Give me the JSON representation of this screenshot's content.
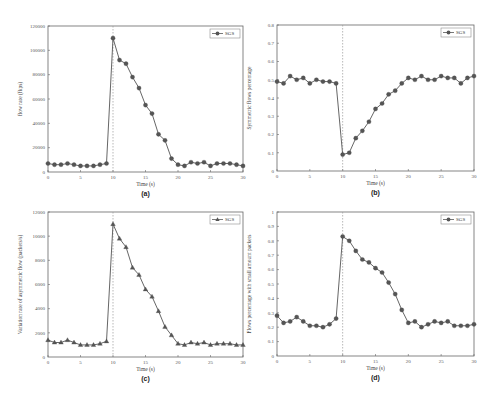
{
  "chart_data": [
    {
      "id": "a",
      "panel_label": "(a)",
      "type": "line",
      "marker": "circle",
      "xlabel": "Time (s)",
      "ylabel": "flow rate (fkps)",
      "xlim": [
        0,
        30
      ],
      "ylim": [
        0,
        120000
      ],
      "xticks": [
        0,
        5,
        10,
        15,
        20,
        25,
        30
      ],
      "yticks": [
        20000,
        40000,
        60000,
        80000,
        100000,
        120000
      ],
      "vline_x": 10,
      "legend": [
        "SGS"
      ],
      "legend_position": "upper right",
      "x": [
        0,
        1,
        2,
        3,
        4,
        5,
        6,
        7,
        8,
        9,
        10,
        11,
        12,
        13,
        14,
        15,
        16,
        17,
        18,
        19,
        20,
        21,
        22,
        23,
        24,
        25,
        26,
        27,
        28,
        29,
        30
      ],
      "series": [
        {
          "name": "SGS",
          "values": [
            7000,
            6000,
            6000,
            7000,
            6000,
            5000,
            5000,
            5000,
            6000,
            7000,
            110000,
            92000,
            89000,
            78000,
            69000,
            55000,
            48000,
            31000,
            26000,
            11000,
            6000,
            5000,
            8000,
            7000,
            8000,
            5000,
            7000,
            7000,
            7000,
            6000,
            5000
          ]
        }
      ]
    },
    {
      "id": "b",
      "panel_label": "(b)",
      "type": "line",
      "marker": "circle",
      "xlabel": "Time (s)",
      "ylabel": "Symmetric flows percentage",
      "xlim": [
        0,
        30
      ],
      "ylim": [
        0,
        0.8
      ],
      "xticks": [
        0,
        5,
        10,
        15,
        20,
        25,
        30
      ],
      "yticks": [
        0.1,
        0.2,
        0.3,
        0.4,
        0.5,
        0.6,
        0.7,
        0.8
      ],
      "vline_x": 10,
      "legend": [
        "SGS"
      ],
      "legend_position": "upper right",
      "x": [
        0,
        1,
        2,
        3,
        4,
        5,
        6,
        7,
        8,
        9,
        10,
        11,
        12,
        13,
        14,
        15,
        16,
        17,
        18,
        19,
        20,
        21,
        22,
        23,
        24,
        25,
        26,
        27,
        28,
        29,
        30
      ],
      "series": [
        {
          "name": "SGS",
          "values": [
            0.49,
            0.48,
            0.52,
            0.5,
            0.51,
            0.48,
            0.5,
            0.49,
            0.49,
            0.48,
            0.09,
            0.1,
            0.18,
            0.22,
            0.27,
            0.34,
            0.37,
            0.42,
            0.44,
            0.48,
            0.51,
            0.5,
            0.52,
            0.5,
            0.5,
            0.52,
            0.51,
            0.51,
            0.48,
            0.51,
            0.52
          ]
        }
      ]
    },
    {
      "id": "c",
      "panel_label": "(c)",
      "type": "line",
      "marker": "triangle",
      "xlabel": "Time (s)",
      "ylabel": "Variation rate of asymmetric flow (packets/s)",
      "xlim": [
        0,
        30
      ],
      "ylim": [
        0,
        12000
      ],
      "xticks": [
        0,
        5,
        10,
        15,
        20,
        25,
        30
      ],
      "yticks": [
        2000,
        4000,
        6000,
        8000,
        10000,
        12000
      ],
      "vline_x": 10,
      "legend": [
        "SGS"
      ],
      "legend_position": "upper right",
      "x": [
        0,
        1,
        2,
        3,
        4,
        5,
        6,
        7,
        8,
        9,
        10,
        11,
        12,
        13,
        14,
        15,
        16,
        17,
        18,
        19,
        20,
        21,
        22,
        23,
        24,
        25,
        26,
        27,
        28,
        29,
        30
      ],
      "series": [
        {
          "name": "SGS",
          "values": [
            1400,
            1200,
            1200,
            1400,
            1200,
            1000,
            1000,
            1000,
            1100,
            1300,
            11000,
            9800,
            9100,
            7400,
            6800,
            5600,
            5000,
            3800,
            2500,
            1800,
            1100,
            1000,
            1200,
            1100,
            1200,
            1000,
            1100,
            1100,
            1100,
            1000,
            1000
          ]
        }
      ]
    },
    {
      "id": "d",
      "panel_label": "(d)",
      "type": "line",
      "marker": "circle",
      "xlabel": "Time (s)",
      "ylabel": "Flows percentage with small amount packets",
      "xlim": [
        0,
        30
      ],
      "ylim": [
        0,
        1.0
      ],
      "xticks": [
        0,
        5,
        10,
        15,
        20,
        25,
        30
      ],
      "yticks": [
        0.1,
        0.2,
        0.3,
        0.4,
        0.5,
        0.6,
        0.7,
        0.8,
        0.9,
        1.0
      ],
      "vline_x": 10,
      "legend": [
        "SGS"
      ],
      "legend_position": "upper right",
      "x": [
        0,
        1,
        2,
        3,
        4,
        5,
        6,
        7,
        8,
        9,
        10,
        11,
        12,
        13,
        14,
        15,
        16,
        17,
        18,
        19,
        20,
        21,
        22,
        23,
        24,
        25,
        26,
        27,
        28,
        29,
        30
      ],
      "series": [
        {
          "name": "SGS",
          "values": [
            0.28,
            0.23,
            0.24,
            0.27,
            0.24,
            0.21,
            0.21,
            0.2,
            0.22,
            0.26,
            0.83,
            0.8,
            0.73,
            0.67,
            0.65,
            0.61,
            0.58,
            0.51,
            0.43,
            0.32,
            0.23,
            0.24,
            0.2,
            0.22,
            0.24,
            0.23,
            0.24,
            0.21,
            0.21,
            0.21,
            0.22
          ]
        }
      ]
    }
  ]
}
